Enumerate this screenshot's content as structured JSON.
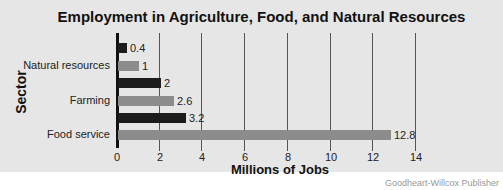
{
  "chart_data": {
    "type": "bar",
    "orientation": "horizontal",
    "title": "Employment in Agriculture, Food, and Natural Resources",
    "xlabel": "Millions of Jobs",
    "ylabel": "Sector",
    "xlim": [
      0,
      14
    ],
    "xticks": [
      "0",
      "2",
      "4",
      "6",
      "8",
      "10",
      "12",
      "14"
    ],
    "grid": "vertical",
    "categories": [
      "Natural resources",
      "Farming",
      "Food service"
    ],
    "bars": [
      {
        "category": "Natural resources",
        "shade": "dark",
        "value": 0.4,
        "label": "0.4"
      },
      {
        "category": "Natural resources",
        "shade": "light",
        "value": 1,
        "label": "1"
      },
      {
        "category": "Farming",
        "shade": "dark",
        "value": 2,
        "label": "2"
      },
      {
        "category": "Farming",
        "shade": "light",
        "value": 2.6,
        "label": "2.6"
      },
      {
        "category": "Food service",
        "shade": "dark",
        "value": 3.2,
        "label": "3.2"
      },
      {
        "category": "Food service",
        "shade": "light",
        "value": 12.8,
        "label": "12.8"
      }
    ],
    "colors": {
      "dark": "#1c1c1c",
      "light": "#8c8c8c",
      "background": "#e6e6e6"
    }
  },
  "credit": "Goodheart-Willcox Publisher"
}
